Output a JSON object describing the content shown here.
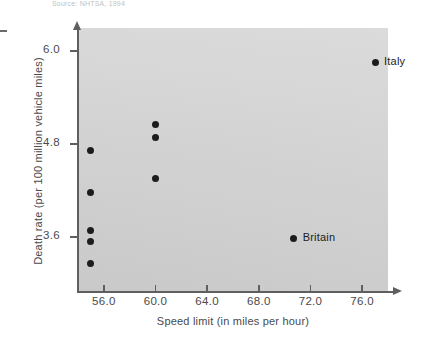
{
  "caption": {
    "top_cut_text": "Source: NHTSA, 1994"
  },
  "chart_data": {
    "type": "scatter",
    "title": "",
    "xlabel": "Speed limit (in miles per hour)",
    "ylabel": "Death rate (per 100 million vehicle miles)",
    "xlim": [
      54.0,
      78.0
    ],
    "ylim": [
      2.9,
      6.3
    ],
    "xticks": [
      "56.0",
      "60.0",
      "64.0",
      "68.0",
      "72.0",
      "76.0"
    ],
    "xtick_values": [
      56.0,
      60.0,
      64.0,
      68.0,
      72.0,
      76.0
    ],
    "yticks": [
      "6.0",
      "4.8",
      "3.6"
    ],
    "ytick_values": [
      6.0,
      4.8,
      3.6
    ],
    "grid": false,
    "legend": "none",
    "points": [
      {
        "x": 55.0,
        "y": 4.72,
        "label": ""
      },
      {
        "x": 55.0,
        "y": 4.17,
        "label": ""
      },
      {
        "x": 55.0,
        "y": 3.68,
        "label": ""
      },
      {
        "x": 55.0,
        "y": 3.54,
        "label": ""
      },
      {
        "x": 55.0,
        "y": 3.25,
        "label": ""
      },
      {
        "x": 60.0,
        "y": 5.05,
        "label": ""
      },
      {
        "x": 60.0,
        "y": 4.88,
        "label": ""
      },
      {
        "x": 60.0,
        "y": 4.35,
        "label": ""
      },
      {
        "x": 70.7,
        "y": 3.58,
        "label": "Britain"
      },
      {
        "x": 77.0,
        "y": 5.86,
        "label": "Italy"
      }
    ]
  }
}
